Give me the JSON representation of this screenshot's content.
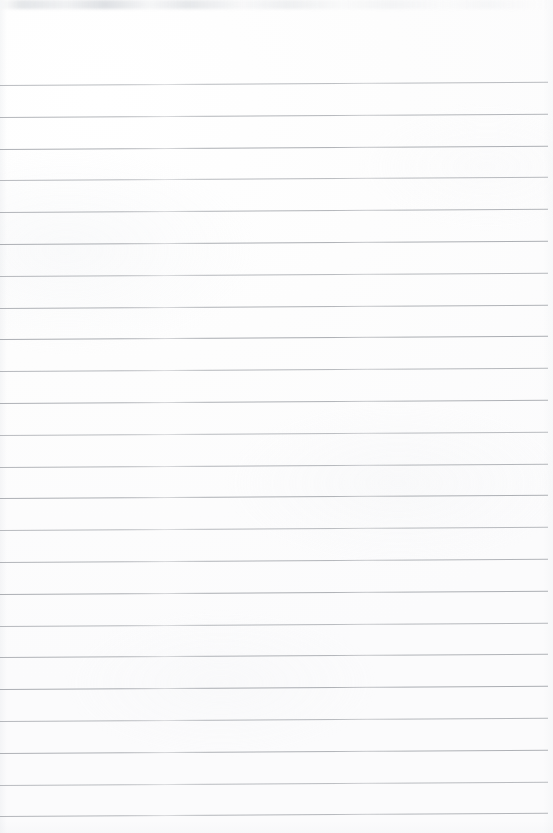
{
  "page": {
    "kind": "scanned-lined-notebook-paper",
    "width_px": 553,
    "height_px": 833,
    "background_color": "#fdfdfd",
    "has_text": false,
    "has_handwriting": false,
    "has_margin_rule": false,
    "header_blank_height_px": 85,
    "top_edge_artifact": "faint-gray-smudge-band"
  },
  "ruling": {
    "line_color": "#a9acb1",
    "line_thickness_px": 1,
    "line_count": 24,
    "first_line_y_px": 85,
    "last_line_y_px": 816,
    "spacing_px": 31.8,
    "skew_rise_px": 3.2,
    "left_inset_px": 0,
    "right_inset_px": 5,
    "lines_y_px": [
      85,
      116.8,
      148.6,
      180.4,
      212.2,
      244,
      275.8,
      307.6,
      339.4,
      371.2,
      403,
      434.8,
      466.6,
      498.4,
      530.2,
      562,
      593.8,
      625.6,
      657.4,
      689.2,
      721,
      752.8,
      784.6,
      816.4
    ]
  }
}
